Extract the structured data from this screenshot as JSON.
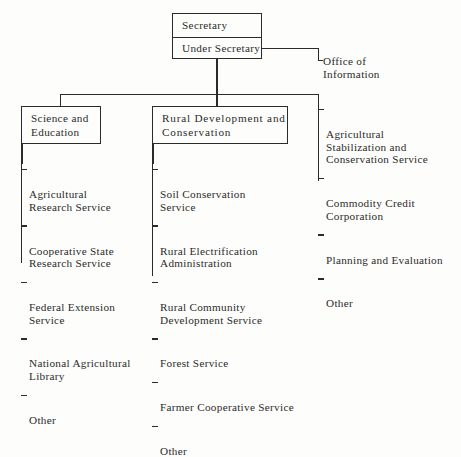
{
  "chart": {
    "type": "organization-chart",
    "title_box": {
      "rows": [
        {
          "label": "Secretary"
        },
        {
          "label": "Under Secretary"
        }
      ]
    },
    "office_of_information": {
      "label": "Office of\n    Information"
    },
    "divisions": [
      {
        "name": "science-and-education",
        "box_label": "Science and\nEducation",
        "items": [
          "Agricultural\nResearch Service",
          "Cooperative State\nResearch Service",
          "Federal Extension\nService",
          "National Agricultural\nLibrary",
          "Other"
        ]
      },
      {
        "name": "rural-development-and-conservation",
        "box_label": "Rural Development and\nConservation",
        "items": [
          "Soil Conservation\nService",
          "Rural Electrification\nAdministration",
          "Rural Community\nDevelopment Service",
          "Forest Service",
          "Farmer Cooperative Service",
          "Other"
        ]
      },
      {
        "name": "other-agencies",
        "box_label": "",
        "items": [
          "Agricultural\nStabilization and\nConservation Service",
          "Commodity Credit\nCorporation",
          "Planning and Evaluation",
          "Other"
        ]
      }
    ],
    "colors": {
      "line": "#2b2b2b",
      "text": "#2b2b2b",
      "background": "#fdfdfb"
    }
  }
}
